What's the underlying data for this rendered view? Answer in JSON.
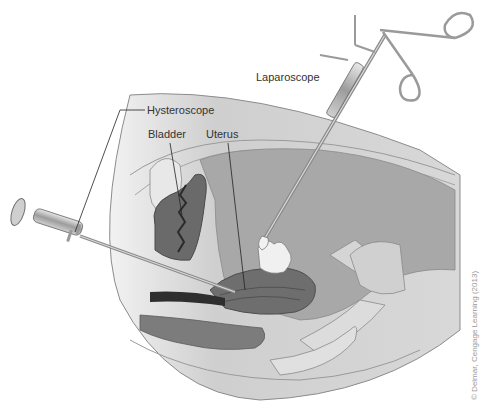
{
  "figure": {
    "labels": {
      "laparoscope": "Laparoscope",
      "hysteroscope": "Hysteroscope",
      "bladder": "Bladder",
      "uterus": "Uterus"
    },
    "credit": "© Delmar, Cengage Learning (2013)",
    "colors": {
      "background": "#ffffff",
      "body_outline": "#8c8c8c",
      "skin": "#d9d9d9",
      "tissue_light": "#e6e6e6",
      "cavity": "#a8a8a8",
      "organ_dark": "#5a5a5a",
      "instrument": "#b5b5b5",
      "label_text": "#333333"
    }
  }
}
